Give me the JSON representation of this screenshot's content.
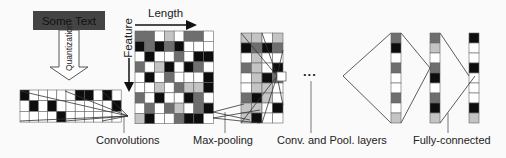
{
  "palette": {
    "B": "#0d0d0d",
    "D": "#6e6e6e",
    "L": "#c4c4c4",
    "W": "#ffffff",
    "line": "#333333",
    "grid_line": "#666666"
  },
  "text_box": {
    "label": "Some Text"
  },
  "quantization": {
    "label": "Quantization"
  },
  "axes": {
    "length_label": "Length",
    "feature_label": "Feature"
  },
  "ellipsis": "...",
  "labels": {
    "convolutions": "Convolutions",
    "max_pooling": "Max-pooling",
    "conv_pool_layers": "Conv. and Pool. layers",
    "fully_connected": "Fully-connected"
  },
  "input_grid": {
    "x": 20,
    "y": 90,
    "cell_w": 9.2,
    "cell_h": 10.7,
    "rows": [
      [
        "B",
        "W",
        "W",
        "W",
        "W",
        "W",
        "B",
        "B",
        "W",
        "B",
        "W"
      ],
      [
        "W",
        "B",
        "W",
        "B",
        "W",
        "W",
        "W",
        "W",
        "W",
        "W",
        "B"
      ],
      [
        "W",
        "W",
        "W",
        "W",
        "B",
        "W",
        "W",
        "W",
        "W",
        "W",
        "W"
      ]
    ]
  },
  "feature_grid": {
    "x": 135,
    "y": 31,
    "cell_w": 9.8,
    "cell_h": 10.3,
    "rows": [
      [
        "D",
        "D",
        "W",
        "L",
        "W",
        "D",
        "D",
        "W"
      ],
      [
        "B",
        "D",
        "B",
        "D",
        "B",
        "W",
        "W",
        "W"
      ],
      [
        "W",
        "B",
        "W",
        "W",
        "D",
        "W",
        "B",
        "B"
      ],
      [
        "D",
        "W",
        "L",
        "B",
        "W",
        "B",
        "D",
        "W"
      ],
      [
        "W",
        "B",
        "W",
        "D",
        "W",
        "W",
        "W",
        "B"
      ],
      [
        "W",
        "W",
        "L",
        "W",
        "D",
        "L",
        "L",
        "B"
      ],
      [
        "D",
        "W",
        "B",
        "W",
        "W",
        "B",
        "D",
        "W"
      ],
      [
        "W",
        "D",
        "W",
        "D",
        "L",
        "W",
        "D",
        "B"
      ],
      [
        "L",
        "B",
        "W",
        "W",
        "D",
        "B",
        "B",
        "W"
      ]
    ]
  },
  "pool_grid": {
    "x": 241,
    "y": 33,
    "cell_w": 10.5,
    "cell_h": 10,
    "rows": [
      [
        "L",
        "L",
        "W",
        "L"
      ],
      [
        "B",
        "D",
        "B",
        "D"
      ],
      [
        "W",
        "L",
        "W",
        "W"
      ],
      [
        "D",
        "L",
        "W",
        "B"
      ],
      [
        "W",
        "L",
        "B",
        "D"
      ],
      [
        "W",
        "L",
        "L",
        "W"
      ],
      [
        "D",
        "B",
        "L",
        "W"
      ],
      [
        "L",
        "L",
        "W",
        "B"
      ],
      [
        "L",
        "B",
        "W",
        "W"
      ]
    ]
  },
  "small_box": {
    "x": 277,
    "y": 72,
    "w": 9,
    "h": 9
  },
  "fc_columns": [
    {
      "x": 391,
      "y": 33,
      "cell_w": 10,
      "cell_h": 10,
      "cells": [
        "D",
        "B",
        "W",
        "D",
        "W",
        "W",
        "D",
        "W",
        "L"
      ]
    },
    {
      "x": 430,
      "y": 33,
      "cell_w": 10,
      "cell_h": 10,
      "cells": [
        "D",
        "L",
        "W",
        "D",
        "B",
        "W",
        "D",
        "B",
        "L"
      ]
    },
    {
      "x": 469,
      "y": 33,
      "cell_w": 10,
      "cell_h": 10,
      "cells": [
        "B",
        "W",
        "W",
        "B",
        "W",
        "W",
        "W",
        "B",
        "L"
      ]
    }
  ]
}
